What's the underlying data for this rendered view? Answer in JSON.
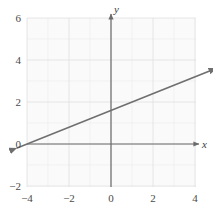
{
  "figure": {
    "type": "coordinate-plane",
    "background_color": "#ffffff",
    "plot_background_color": "#fafafa",
    "grid_color": "#e6e6e6",
    "axis_color": "#6b6b6b",
    "line_color": "#6f6f6f",
    "label_color": "#4a4a4a",
    "x_axis_name": "x",
    "y_axis_name": "y"
  },
  "chart_data": {
    "type": "line",
    "title": "",
    "xlabel": "x",
    "ylabel": "y",
    "xlim": [
      -5,
      4.8
    ],
    "ylim": [
      -3,
      7
    ],
    "grid": true,
    "legend": "none",
    "x_ticks": [
      -4,
      -2,
      0,
      2,
      4
    ],
    "x_tick_labels": [
      "−4",
      "−2",
      "0",
      "2",
      "4"
    ],
    "y_ticks": [
      -2,
      0,
      2,
      4,
      6
    ],
    "y_tick_labels": [
      "−2",
      "0",
      "2",
      "4",
      "6"
    ],
    "grid_step": 1,
    "series": [
      {
        "name": "line",
        "style": "double-arrow-line",
        "slope": 0.4,
        "y_intercept": 1.6,
        "x_intercept": -4.0,
        "endpoints": [
          {
            "x": -4.5,
            "y": -0.2
          },
          {
            "x": 5.0,
            "y": 3.6
          }
        ],
        "arrow_start": true,
        "arrow_end": true
      }
    ]
  },
  "x_tick_labels": [
    {
      "value": -4,
      "text": "−4"
    },
    {
      "value": -2,
      "text": "−2"
    },
    {
      "value": 0,
      "text": "0"
    },
    {
      "value": 2,
      "text": "2"
    },
    {
      "value": 4,
      "text": "4"
    }
  ],
  "y_tick_labels": [
    {
      "value": 6,
      "text": "6"
    },
    {
      "value": 4,
      "text": "4"
    },
    {
      "value": 2,
      "text": "2"
    },
    {
      "value": 0,
      "text": "0"
    },
    {
      "value": -2,
      "text": "−2"
    }
  ]
}
